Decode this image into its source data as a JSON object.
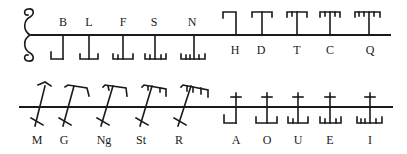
{
  "rows": [
    {
      "name": "top-row",
      "groups": [
        {
          "position": "below",
          "letters": [
            {
              "label": "B",
              "strokes": 1,
              "x": 63
            },
            {
              "label": "L",
              "strokes": 2,
              "x": 89
            },
            {
              "label": "F",
              "strokes": 3,
              "x": 123
            },
            {
              "label": "S",
              "strokes": 4,
              "x": 155
            },
            {
              "label": "N",
              "strokes": 5,
              "x": 194
            }
          ]
        },
        {
          "position": "above",
          "letters": [
            {
              "label": "H",
              "strokes": 1,
              "x": 236
            },
            {
              "label": "D",
              "strokes": 2,
              "x": 262
            },
            {
              "label": "T",
              "strokes": 3,
              "x": 297
            },
            {
              "label": "C",
              "strokes": 4,
              "x": 330
            },
            {
              "label": "Q",
              "strokes": 5,
              "x": 369
            }
          ]
        }
      ]
    },
    {
      "name": "bottom-row",
      "groups": [
        {
          "position": "diagonal",
          "letters": [
            {
              "label": "M",
              "strokes": 1,
              "x": 37
            },
            {
              "label": "G",
              "strokes": 2,
              "x": 64
            },
            {
              "label": "Ng",
              "strokes": 3,
              "x": 104
            },
            {
              "label": "St",
              "strokes": 4,
              "x": 141
            },
            {
              "label": "R",
              "strokes": 5,
              "x": 179
            }
          ]
        },
        {
          "position": "across",
          "letters": [
            {
              "label": "A",
              "strokes": 1,
              "x": 236
            },
            {
              "label": "O",
              "strokes": 2,
              "x": 267
            },
            {
              "label": "U",
              "strokes": 3,
              "x": 298
            },
            {
              "label": "E",
              "strokes": 4,
              "x": 330
            },
            {
              "label": "I",
              "strokes": 5,
              "x": 370
            }
          ]
        }
      ]
    }
  ],
  "colors": {
    "ink": "#1a1a1a",
    "background": "#ffffff"
  }
}
